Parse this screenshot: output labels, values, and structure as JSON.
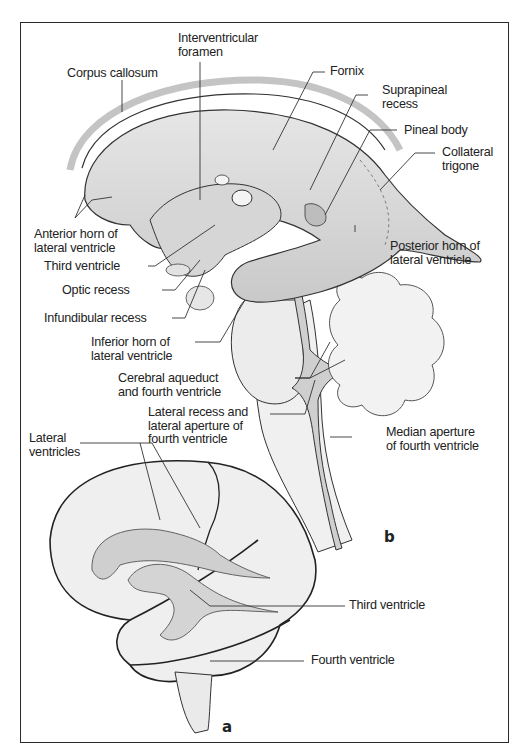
{
  "figure": {
    "panels": [
      {
        "id": "b",
        "letter": "b",
        "description": "Cast of ventricular system, lateral view"
      },
      {
        "id": "a",
        "letter": "a",
        "description": "Ventricles projected within brain"
      }
    ]
  },
  "labels_b": {
    "interventricular_foramen": "Interventricular\nforamen",
    "corpus_callosum": "Corpus callosum",
    "fornix": "Fornix",
    "suprapineal_recess": "Suprapineal\nrecess",
    "pineal_body": "Pineal body",
    "collateral_trigone": "Collateral\ntrigone",
    "anterior_horn": "Anterior horn of\nlateral ventricle",
    "third_ventricle": "Third ventricle",
    "optic_recess": "Optic recess",
    "infundibular_recess": "Infundibular recess",
    "posterior_horn": "Posterior horn of\nlateral ventricle",
    "inferior_horn": "Inferior horn of\nlateral ventricle",
    "cerebral_aqueduct": "Cerebral aqueduct\nand fourth ventricle",
    "lateral_recess": "Lateral recess and\nlateral aperture of\nfourth ventricle",
    "median_aperture": "Median aperture\nof fourth ventricle"
  },
  "labels_a": {
    "lateral_ventricles": "Lateral\nventricles",
    "third_ventricle": "Third ventricle",
    "fourth_ventricle": "Fourth ventricle"
  },
  "colors": {
    "frame": "#2a2a2a",
    "ventricle_fill": "#d9d9d9",
    "ventricle_dark": "#b8b8b8",
    "tissue_fill": "#eeeeee",
    "outline": "#333333",
    "leader": "#333333"
  }
}
